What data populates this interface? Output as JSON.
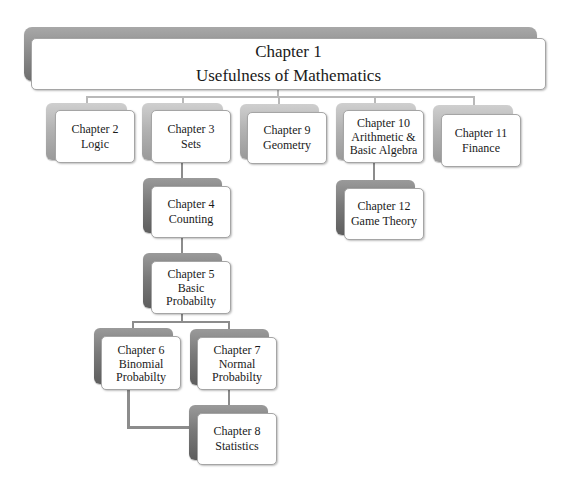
{
  "diagram": {
    "type": "hierarchy",
    "root": {
      "id": "ch1",
      "title": "Chapter 1",
      "subtitle": "Usefulness of Mathematics"
    },
    "nodes": [
      {
        "id": "ch2",
        "title": "Chapter 2",
        "lines": [
          "Logic"
        ],
        "parent": "ch1"
      },
      {
        "id": "ch3",
        "title": "Chapter 3",
        "lines": [
          "Sets"
        ],
        "parent": "ch1"
      },
      {
        "id": "ch9",
        "title": "Chapter 9",
        "lines": [
          "Geometry"
        ],
        "parent": "ch1"
      },
      {
        "id": "ch10",
        "title": "Chapter 10",
        "lines": [
          "Arithmetic &",
          "Basic Algebra"
        ],
        "parent": "ch1"
      },
      {
        "id": "ch11",
        "title": "Chapter 11",
        "lines": [
          "Finance"
        ],
        "parent": "ch1"
      },
      {
        "id": "ch12",
        "title": "Chapter 12",
        "lines": [
          "Game Theory"
        ],
        "parent": "ch10"
      },
      {
        "id": "ch4",
        "title": "Chapter 4",
        "lines": [
          "Counting"
        ],
        "parent": "ch3"
      },
      {
        "id": "ch5",
        "title": "Chapter 5",
        "lines": [
          "Basic",
          "Probabilty"
        ],
        "parent": "ch4"
      },
      {
        "id": "ch6",
        "title": "Chapter 6",
        "lines": [
          "Binomial",
          "Probabilty"
        ],
        "parent": "ch5"
      },
      {
        "id": "ch7",
        "title": "Chapter 7",
        "lines": [
          "Normal",
          "Probabilty"
        ],
        "parent": "ch5"
      },
      {
        "id": "ch8",
        "title": "Chapter 8",
        "lines": [
          "Statistics"
        ],
        "parent": [
          "ch6",
          "ch7"
        ]
      }
    ],
    "colors": {
      "box_fill": "#ffffff",
      "box_border": "#a5a5a5",
      "back_light": "#b3b3b3",
      "back_dark": "#7a7a7a",
      "connector_light": "#b9b9b9",
      "connector_dark": "#8c8c8c"
    }
  }
}
